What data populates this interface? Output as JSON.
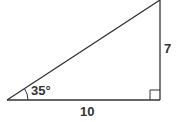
{
  "diagram": {
    "type": "right-triangle",
    "angle_label": "35°",
    "base_label": "10",
    "height_label": "7",
    "right_angle_marker": true,
    "stroke_color": "#333333"
  }
}
